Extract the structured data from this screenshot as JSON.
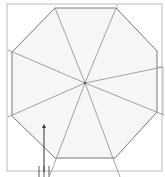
{
  "diagram": {
    "type": "octagonal-floor-plan",
    "colors": {
      "background": "#ffffff",
      "fill": "#f6f6f6",
      "outer_frame": "#bdbdbd",
      "octagon_edge": "#7a7a7a",
      "spoke": "#8c8c8c",
      "arrow": "#333333"
    },
    "outer_frame": {
      "x": 7,
      "y": 4,
      "w": 155,
      "h": 167
    },
    "notch": {
      "points": "117,4 117,67 163,67 163,115"
    },
    "octagon": {
      "points": "55,8 116,8 157,51 157,112 115,158 55,158 12,116 12,52"
    },
    "center": {
      "x": 85,
      "y": 83
    },
    "spokes": [
      {
        "x": 55,
        "y": 8
      },
      {
        "x": 116,
        "y": 8
      },
      {
        "x": 163,
        "y": 67
      },
      {
        "x": 164,
        "y": 115
      },
      {
        "x": 120,
        "y": 177
      },
      {
        "x": 50,
        "y": 175
      },
      {
        "x": 8,
        "y": 117
      },
      {
        "x": 8,
        "y": 50
      }
    ],
    "entry_arrow": {
      "x": 44,
      "y1": 172,
      "y2": 124,
      "label": "entrance"
    },
    "entry_ticks": [
      {
        "x": 39,
        "y1": 166,
        "y2": 177
      },
      {
        "x": 44,
        "y1": 166,
        "y2": 177
      },
      {
        "x": 49,
        "y1": 166,
        "y2": 177
      }
    ]
  }
}
